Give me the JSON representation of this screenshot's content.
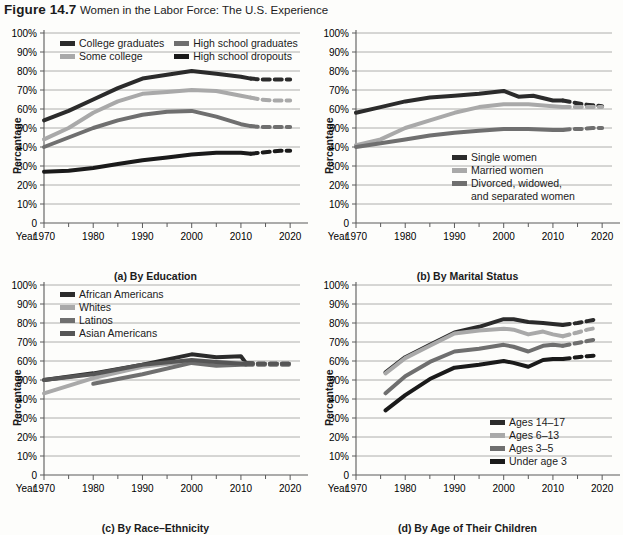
{
  "figure": {
    "number": "Figure 14.7",
    "title": "Women in the Labor Force: The U.S. Experience"
  },
  "axis_common": {
    "ylabel": "Percentage",
    "year_label": "Year",
    "yticks": [
      "100%",
      "90%",
      "80%",
      "70%",
      "60%",
      "50%",
      "40%",
      "30%",
      "20%",
      "10%",
      "0"
    ],
    "xticks": [
      "1970",
      "1980",
      "1990",
      "2000",
      "2010",
      "2020"
    ]
  },
  "colors": {
    "dark": "#2b2b2b",
    "light_gray": "#a9a9a9",
    "mid_gray": "#6f6f6f",
    "darkest": "#1a1a1a",
    "grid": "#9b9b9b",
    "axis": "#5a5a5a"
  },
  "chart_data": [
    {
      "id": "a",
      "type": "line",
      "title": "(a) By Education",
      "xlabel": "Year",
      "ylabel": "Percentage",
      "ylim": [
        0,
        100
      ],
      "xlim": [
        1970,
        2022
      ],
      "grid": true,
      "legend_position": "top-inside",
      "series": [
        {
          "name": "College graduates",
          "color": "#2b2b2b",
          "x": [
            1970,
            1975,
            1980,
            1985,
            1990,
            1995,
            2000,
            2005,
            2010,
            2012
          ],
          "values": [
            54,
            59,
            65,
            71,
            76,
            78,
            80,
            78.5,
            77,
            76
          ],
          "projection_x": [
            2012,
            2014,
            2016,
            2018,
            2020
          ],
          "projection_values": [
            76,
            75.5,
            75.5,
            75.5,
            75.5
          ],
          "projected": true
        },
        {
          "name": "Some college",
          "color": "#a9a9a9",
          "x": [
            1970,
            1975,
            1980,
            1985,
            1990,
            1995,
            2000,
            2005,
            2010,
            2012
          ],
          "values": [
            44,
            50,
            58,
            64,
            68,
            69,
            70,
            69.5,
            67,
            66
          ],
          "projection_x": [
            2012,
            2014,
            2016,
            2018,
            2020
          ],
          "projection_values": [
            66,
            65,
            64.5,
            64.5,
            64.5
          ],
          "projected": true
        },
        {
          "name": "High school graduates",
          "color": "#6f6f6f",
          "x": [
            1970,
            1975,
            1980,
            1985,
            1990,
            1995,
            2000,
            2005,
            2010,
            2012
          ],
          "values": [
            40,
            45,
            50,
            54,
            57,
            58.5,
            59,
            56,
            52,
            51
          ],
          "projection_x": [
            2012,
            2014,
            2016,
            2018,
            2020
          ],
          "projection_values": [
            51,
            50.5,
            50.5,
            50.5,
            50.5
          ],
          "projected": true
        },
        {
          "name": "High school dropouts",
          "color": "#1a1a1a",
          "x": [
            1970,
            1975,
            1980,
            1985,
            1990,
            1995,
            2000,
            2005,
            2010,
            2012
          ],
          "values": [
            27,
            27.5,
            29,
            31,
            33,
            34.5,
            36,
            37,
            37,
            36.5
          ],
          "projection_x": [
            2012,
            2014,
            2016,
            2018,
            2020
          ],
          "projection_values": [
            36.5,
            37,
            37.5,
            38,
            38
          ],
          "projected": true
        }
      ]
    },
    {
      "id": "b",
      "type": "line",
      "title": "(b) By Marital Status",
      "xlabel": "Year",
      "ylabel": "Percentage",
      "ylim": [
        0,
        100
      ],
      "xlim": [
        1970,
        2022
      ],
      "grid": true,
      "legend_position": "bottom-inside",
      "series": [
        {
          "name": "Single women",
          "color": "#2b2b2b",
          "x": [
            1970,
            1975,
            1980,
            1985,
            1990,
            1995,
            2000,
            2003,
            2006,
            2010,
            2012
          ],
          "values": [
            58,
            61,
            64,
            66,
            67,
            68,
            69.5,
            66.5,
            67,
            64.5,
            64.5
          ],
          "projection_x": [
            2012,
            2014,
            2016,
            2018,
            2020
          ],
          "projection_values": [
            64.5,
            63.5,
            62.5,
            62,
            61.5
          ],
          "projected": true
        },
        {
          "name": "Married women",
          "color": "#a9a9a9",
          "x": [
            1970,
            1975,
            1980,
            1985,
            1990,
            1995,
            2000,
            2005,
            2010,
            2012
          ],
          "values": [
            41,
            44,
            50,
            54,
            58,
            61,
            62.5,
            62.5,
            61.5,
            61
          ],
          "projection_x": [
            2012,
            2014,
            2016,
            2018,
            2020
          ],
          "projection_values": [
            61,
            61,
            61,
            61,
            61
          ],
          "projected": true
        },
        {
          "name": "Divorced, widowed, and separated women",
          "color": "#6f6f6f",
          "x": [
            1970,
            1975,
            1980,
            1985,
            1990,
            1995,
            2000,
            2005,
            2010,
            2012
          ],
          "values": [
            40,
            42,
            44,
            46,
            47.5,
            48.5,
            49.5,
            49.5,
            49,
            49
          ],
          "projection_x": [
            2012,
            2014,
            2016,
            2018,
            2020
          ],
          "projection_values": [
            49,
            49.5,
            49.5,
            50,
            50
          ],
          "projected": true
        }
      ]
    },
    {
      "id": "c",
      "type": "line",
      "title": "(c) By Race–Ethnicity",
      "xlabel": "Year",
      "ylabel": "Percentage",
      "ylim": [
        0,
        100
      ],
      "xlim": [
        1970,
        2022
      ],
      "grid": true,
      "legend_position": "top-inside",
      "series": [
        {
          "name": "African Americans",
          "color": "#2b2b2b",
          "x": [
            1970,
            1980,
            1990,
            2000,
            2005,
            2010,
            2011
          ],
          "values": [
            50,
            53.5,
            58,
            63.5,
            62,
            62.5,
            59
          ],
          "projection_x": [
            2011,
            2014,
            2017,
            2020
          ],
          "projection_values": [
            59,
            58.5,
            58.5,
            58.5
          ],
          "projected": true
        },
        {
          "name": "Whites",
          "color": "#a9a9a9",
          "x": [
            1970,
            1980,
            1990,
            2000,
            2005,
            2010,
            2011
          ],
          "values": [
            43,
            51,
            57,
            60,
            59.5,
            59,
            58.5
          ],
          "projection_x": [
            2011,
            2014,
            2017,
            2020
          ],
          "projection_values": [
            58.5,
            58.5,
            58.5,
            58.5
          ],
          "projected": true
        },
        {
          "name": "Latinos",
          "color": "#6f6f6f",
          "x": [
            1980,
            1990,
            2000,
            2005,
            2010,
            2011
          ],
          "values": [
            48,
            53,
            59,
            57.5,
            58,
            58
          ],
          "projection_x": [
            2011,
            2014,
            2017,
            2020
          ],
          "projection_values": [
            58,
            58,
            58,
            58
          ],
          "projected": true
        },
        {
          "name": "Asian Americans",
          "color": "#565656",
          "x": [
            1970,
            1980,
            1990,
            2000,
            2005,
            2010,
            2011
          ],
          "values": [
            50,
            53,
            58,
            60.5,
            59.5,
            58.5,
            58.5
          ],
          "projection_x": [
            2011,
            2014,
            2017,
            2020
          ],
          "projection_values": [
            58.5,
            58.5,
            58.5,
            58.5
          ],
          "projected": true
        }
      ]
    },
    {
      "id": "d",
      "type": "line",
      "title": "(d) By Age of Their Children",
      "xlabel": "Year",
      "ylabel": "Percentage",
      "ylim": [
        0,
        100
      ],
      "xlim": [
        1970,
        2022
      ],
      "grid": true,
      "legend_position": "bottom-right-inside",
      "series": [
        {
          "name": "Ages 14–17",
          "color": "#2b2b2b",
          "x": [
            1976,
            1980,
            1985,
            1990,
            1995,
            2000,
            2002,
            2005,
            2008,
            2010,
            2012
          ],
          "values": [
            54,
            62,
            68.5,
            75,
            78,
            82,
            82,
            80.5,
            80,
            79.5,
            79
          ],
          "projection_x": [
            2012,
            2015,
            2017,
            2019
          ],
          "projection_values": [
            79,
            80,
            81,
            82
          ],
          "projected": true
        },
        {
          "name": "Ages 6–13",
          "color": "#a9a9a9",
          "x": [
            1976,
            1980,
            1985,
            1990,
            1995,
            2000,
            2002,
            2005,
            2008,
            2010,
            2012
          ],
          "values": [
            53.5,
            61.5,
            68,
            74.5,
            76,
            77,
            76.5,
            74,
            75.5,
            74,
            73
          ],
          "projection_x": [
            2012,
            2015,
            2017,
            2019
          ],
          "projection_values": [
            73,
            75,
            76.5,
            77.5
          ],
          "projected": true
        },
        {
          "name": "Ages 3–5",
          "color": "#6f6f6f",
          "x": [
            1976,
            1980,
            1985,
            1990,
            1995,
            2000,
            2002,
            2005,
            2008,
            2010,
            2012
          ],
          "values": [
            43,
            52,
            59.5,
            65,
            66.5,
            68.5,
            67.5,
            65,
            68,
            68.5,
            68
          ],
          "projection_x": [
            2012,
            2015,
            2017,
            2019
          ],
          "projection_values": [
            68,
            69.5,
            70.5,
            71.5
          ],
          "projected": true
        },
        {
          "name": "Under age 3",
          "color": "#1a1a1a",
          "x": [
            1976,
            1980,
            1985,
            1990,
            1995,
            2000,
            2002,
            2005,
            2008,
            2010,
            2012
          ],
          "values": [
            34,
            42,
            50.5,
            56.5,
            58,
            60,
            59,
            57,
            60.5,
            61,
            61
          ],
          "projection_x": [
            2012,
            2015,
            2017,
            2019
          ],
          "projection_values": [
            61,
            62,
            62.5,
            63
          ],
          "projected": true
        }
      ]
    }
  ],
  "panels": {
    "a": {
      "legend": [
        {
          "label": "College graduates",
          "color": "#2b2b2b"
        },
        {
          "label": "Some college",
          "color": "#a9a9a9"
        },
        {
          "label": "High school graduates",
          "color": "#6f6f6f"
        },
        {
          "label": "High school dropouts",
          "color": "#1a1a1a"
        }
      ]
    },
    "b": {
      "legend": [
        {
          "label": "Single women",
          "color": "#2b2b2b"
        },
        {
          "label": "Married women",
          "color": "#a9a9a9"
        },
        {
          "label": "Divorced, widowed,",
          "label2": "and separated women",
          "color": "#6f6f6f"
        }
      ]
    },
    "c": {
      "legend": [
        {
          "label": "African Americans",
          "color": "#2b2b2b"
        },
        {
          "label": "Whites",
          "color": "#a9a9a9"
        },
        {
          "label": "Latinos",
          "color": "#6f6f6f"
        },
        {
          "label": "Asian Americans",
          "color": "#565656"
        }
      ]
    },
    "d": {
      "legend": [
        {
          "label": "Ages 14–17",
          "color": "#2b2b2b"
        },
        {
          "label": "Ages 6–13",
          "color": "#a9a9a9"
        },
        {
          "label": "Ages 3–5",
          "color": "#6f6f6f"
        },
        {
          "label": "Under age 3",
          "color": "#1a1a1a"
        }
      ]
    }
  }
}
